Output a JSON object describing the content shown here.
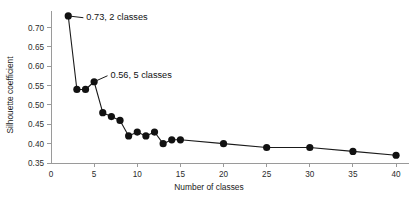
{
  "chart_data": {
    "type": "line",
    "title": "",
    "subtitle": "",
    "xlabel": "Number of classes",
    "ylabel": "Silhouette coefficient",
    "xlim": [
      0,
      41.5
    ],
    "ylim": [
      0.35,
      0.735
    ],
    "grid": false,
    "legend": null,
    "marker": "filled-circle",
    "line_color": "#111111",
    "marker_color": "#111111",
    "axis_color": "#9a9a9a",
    "xticks": [
      0,
      5,
      10,
      15,
      20,
      25,
      30,
      35,
      40
    ],
    "xtick_labels": [
      "0",
      "5",
      "10",
      "15",
      "20",
      "25",
      "30",
      "35",
      "40"
    ],
    "yticks": [
      0.35,
      0.4,
      0.45,
      0.5,
      0.55,
      0.6,
      0.65,
      0.7
    ],
    "ytick_labels": [
      "0.35",
      "0.40",
      "0.45",
      "0.50",
      "0.55",
      "0.60",
      "0.65",
      "0.70"
    ],
    "x": [
      2,
      3,
      4,
      5,
      6,
      7,
      8,
      9,
      10,
      11,
      12,
      13,
      14,
      15,
      20,
      25,
      30,
      35,
      40
    ],
    "values": [
      0.73,
      0.54,
      0.54,
      0.56,
      0.48,
      0.47,
      0.46,
      0.42,
      0.43,
      0.42,
      0.43,
      0.4,
      0.41,
      0.41,
      0.4,
      0.39,
      0.39,
      0.38,
      0.37
    ],
    "series": [
      {
        "name": "Silhouette coefficient",
        "values": [
          0.73,
          0.54,
          0.54,
          0.56,
          0.48,
          0.47,
          0.46,
          0.42,
          0.43,
          0.42,
          0.43,
          0.4,
          0.41,
          0.41,
          0.4,
          0.39,
          0.39,
          0.38,
          0.37
        ]
      }
    ],
    "annotations": [
      {
        "label": "0.73, 2 classes",
        "point_x": 2,
        "point_y": 0.73,
        "text_x": 4.1,
        "text_y": 0.728
      },
      {
        "label": "0.56, 5 classes",
        "point_x": 5,
        "point_y": 0.56,
        "text_x": 6.9,
        "text_y": 0.578
      }
    ]
  }
}
